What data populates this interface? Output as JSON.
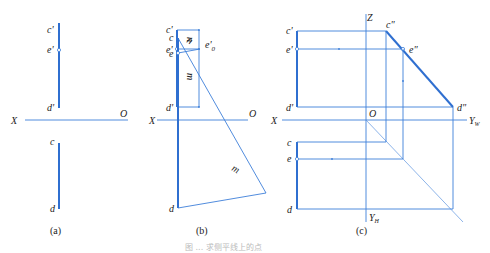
{
  "figure": {
    "caption": "图 ... 求侧平线上的点",
    "line_color": "#3d7fd9"
  },
  "panel_a": {
    "caption": "(a)",
    "labels": {
      "c_prime": "c'",
      "e_prime": "e'",
      "d_prime": "d'",
      "c": "c",
      "d": "d",
      "x_axis": "X",
      "origin": "O"
    }
  },
  "panel_b": {
    "caption": "(b)",
    "labels": {
      "c_prime": "c'",
      "e_prime": "e'",
      "d_prime": "d'",
      "n_upper": "n",
      "m_upper": "m",
      "c": "c",
      "e": "e",
      "d": "d",
      "n_lower": "n",
      "m_lower": "m",
      "e0_prime": "e'",
      "e0_sub": "0",
      "x_axis": "X",
      "origin": "O"
    }
  },
  "panel_c": {
    "caption": "(c)",
    "labels": {
      "c_prime": "c'",
      "e_prime": "e'",
      "d_prime": "d'",
      "c_dprime": "c\"",
      "e_dprime": "e\"",
      "d_dprime": "d\"",
      "c": "c",
      "e": "e",
      "d": "d",
      "z_axis": "Z",
      "x_axis": "X",
      "origin": "O",
      "yw_axis": "Y",
      "yw_sub": "W",
      "yh_axis": "Y",
      "yh_sub": "H"
    }
  }
}
